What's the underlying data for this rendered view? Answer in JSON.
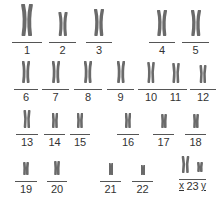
{
  "karyotype": {
    "chromosomes": [
      {
        "label": "1",
        "x": 12,
        "y": 10,
        "w": 30,
        "lineY": 43,
        "h": 32,
        "s": 1.0
      },
      {
        "label": "2",
        "x": 49,
        "y": 10,
        "w": 27,
        "lineY": 43,
        "h": 24,
        "s": 0.8
      },
      {
        "label": "3",
        "x": 86,
        "y": 10,
        "w": 26,
        "lineY": 43,
        "h": 27,
        "s": 0.85
      },
      {
        "label": "4",
        "x": 149,
        "y": 10,
        "w": 26,
        "lineY": 43,
        "h": 26,
        "s": 0.8
      },
      {
        "label": "5",
        "x": 182,
        "y": 10,
        "w": 27,
        "lineY": 43,
        "h": 26,
        "s": 0.8
      },
      {
        "label": "6",
        "x": 14,
        "y": 60,
        "w": 24,
        "lineY": 90,
        "h": 22,
        "s": 0.7
      },
      {
        "label": "7",
        "x": 42,
        "y": 60,
        "w": 27,
        "lineY": 90,
        "h": 22,
        "s": 0.7
      },
      {
        "label": "8",
        "x": 74,
        "y": 60,
        "w": 28,
        "lineY": 90,
        "h": 22,
        "s": 0.7
      },
      {
        "label": "9",
        "x": 107,
        "y": 60,
        "w": 27,
        "lineY": 90,
        "h": 22,
        "s": 0.7
      },
      {
        "label": "10",
        "x": 138,
        "y": 60,
        "w": 26,
        "lineY": 90,
        "h": 21,
        "s": 0.65
      },
      {
        "label": "11",
        "x": 164,
        "y": 60,
        "w": 23,
        "lineY": 90,
        "h": 20,
        "s": 0.6
      },
      {
        "label": "12",
        "x": 190,
        "y": 60,
        "w": 26,
        "lineY": 90,
        "h": 18,
        "s": 0.55
      },
      {
        "label": "13",
        "x": 16,
        "y": 112,
        "w": 22,
        "lineY": 135,
        "h": 18,
        "s": 0.55
      },
      {
        "label": "14",
        "x": 44,
        "y": 112,
        "w": 21,
        "lineY": 135,
        "h": 15,
        "s": 0.5
      },
      {
        "label": "15",
        "x": 70,
        "y": 112,
        "w": 20,
        "lineY": 135,
        "h": 15,
        "s": 0.5
      },
      {
        "label": "16",
        "x": 117,
        "y": 112,
        "w": 22,
        "lineY": 135,
        "h": 15,
        "s": 0.5
      },
      {
        "label": "17",
        "x": 153,
        "y": 112,
        "w": 21,
        "lineY": 135,
        "h": 14,
        "s": 0.45
      },
      {
        "label": "18",
        "x": 185,
        "y": 112,
        "w": 21,
        "lineY": 135,
        "h": 14,
        "s": 0.45
      },
      {
        "label": "19",
        "x": 15,
        "y": 160,
        "w": 22,
        "lineY": 182,
        "h": 13,
        "s": 0.42
      },
      {
        "label": "20",
        "x": 47,
        "y": 160,
        "w": 20,
        "lineY": 182,
        "h": 14,
        "s": 0.45
      },
      {
        "label": "21",
        "x": 100,
        "y": 160,
        "w": 21,
        "lineY": 182,
        "h": 12,
        "s": 0.38
      },
      {
        "label": "22",
        "x": 132,
        "y": 160,
        "w": 21,
        "lineY": 182,
        "h": 10,
        "s": 0.32
      }
    ],
    "sex_pair": {
      "label": "23",
      "x_label": "x",
      "y_label": "y",
      "x": 179,
      "y": 155,
      "w": 27,
      "lineY": 180
    },
    "colors": {
      "chromosome": "#6a6a6a",
      "line": "#555555",
      "text": "#333333"
    }
  }
}
